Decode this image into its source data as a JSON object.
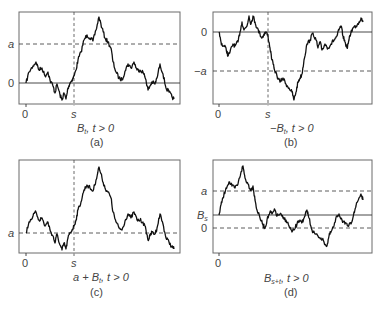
{
  "figure": {
    "panels": [
      {
        "id": "a",
        "caption": "(a)",
        "title_main": "B",
        "title_sub": "t",
        "title_rest": ", t > 0",
        "y_labels": [
          {
            "text": "a",
            "level": "a",
            "style": "dashed"
          },
          {
            "text": "0",
            "level": "0",
            "style": "solid"
          }
        ],
        "x_labels": [
          "0",
          "s"
        ],
        "stopping_time_marker": "s"
      },
      {
        "id": "b",
        "caption": "(b)",
        "title_main": "−B",
        "title_sub": "t",
        "title_rest": ", t > 0",
        "y_labels": [
          {
            "text": "0",
            "level": "0",
            "style": "solid"
          },
          {
            "text": "−a",
            "level": "-a",
            "style": "dashed"
          }
        ],
        "x_labels": [
          "0",
          "s"
        ],
        "stopping_time_marker": "s"
      },
      {
        "id": "c",
        "caption": "(c)",
        "title_main": "a + B",
        "title_sub": "t",
        "title_rest": ", t > 0",
        "y_labels": [
          {
            "text": "a",
            "level": "a",
            "style": "dashed"
          }
        ],
        "x_labels": [
          "0",
          "s"
        ],
        "stopping_time_marker": "s"
      },
      {
        "id": "d",
        "caption": "(d)",
        "title_main": "B",
        "title_sub": "s+t",
        "title_rest": ", t > 0",
        "y_labels": [
          {
            "text": "a",
            "level": "a",
            "style": "dashed"
          },
          {
            "text": "B",
            "sub": "s",
            "level": "Bs",
            "style": "solid"
          },
          {
            "text": "0",
            "level": "0",
            "style": "dashed"
          }
        ],
        "x_labels": [
          "0"
        ]
      }
    ],
    "paths": {
      "a": [
        [
          26,
          83
        ],
        [
          29,
          72
        ],
        [
          33,
          66
        ],
        [
          36,
          62
        ],
        [
          39,
          70
        ],
        [
          42,
          68
        ],
        [
          45,
          76
        ],
        [
          48,
          72
        ],
        [
          50,
          80
        ],
        [
          53,
          86
        ],
        [
          55,
          93
        ],
        [
          57,
          84
        ],
        [
          60,
          95
        ],
        [
          62,
          100
        ],
        [
          64,
          93
        ],
        [
          66,
          99
        ],
        [
          68,
          88
        ],
        [
          70,
          83
        ],
        [
          72,
          80
        ],
        [
          74,
          76
        ],
        [
          76,
          70
        ],
        [
          78,
          60
        ],
        [
          81,
          52
        ],
        [
          84,
          40
        ],
        [
          87,
          35
        ],
        [
          90,
          38
        ],
        [
          93,
          41
        ],
        [
          96,
          30
        ],
        [
          99,
          17
        ],
        [
          102,
          28
        ],
        [
          105,
          38
        ],
        [
          108,
          42
        ],
        [
          111,
          48
        ],
        [
          113,
          62
        ],
        [
          116,
          72
        ],
        [
          119,
          78
        ],
        [
          122,
          80
        ],
        [
          125,
          71
        ],
        [
          128,
          64
        ],
        [
          131,
          68
        ],
        [
          134,
          62
        ],
        [
          137,
          70
        ],
        [
          140,
          70
        ],
        [
          143,
          72
        ],
        [
          146,
          80
        ],
        [
          148,
          90
        ],
        [
          150,
          86
        ],
        [
          152,
          82
        ],
        [
          155,
          84
        ],
        [
          157,
          78
        ],
        [
          160,
          64
        ],
        [
          163,
          74
        ],
        [
          166,
          88
        ],
        [
          169,
          92
        ],
        [
          172,
          97
        ],
        [
          174,
          99
        ]
      ],
      "b": [
        [
          219,
          32
        ],
        [
          221,
          42
        ],
        [
          223,
          46
        ],
        [
          226,
          48
        ],
        [
          228,
          56
        ],
        [
          230,
          52
        ],
        [
          233,
          44
        ],
        [
          235,
          46
        ],
        [
          238,
          42
        ],
        [
          240,
          32
        ],
        [
          242,
          22
        ],
        [
          244,
          30
        ],
        [
          247,
          26
        ],
        [
          249,
          16
        ],
        [
          251,
          24
        ],
        [
          253,
          16
        ],
        [
          255,
          22
        ],
        [
          257,
          28
        ],
        [
          260,
          34
        ],
        [
          262,
          38
        ],
        [
          264,
          34
        ],
        [
          266,
          32
        ],
        [
          268,
          36
        ],
        [
          270,
          48
        ],
        [
          272,
          60
        ],
        [
          274,
          68
        ],
        [
          277,
          76
        ],
        [
          280,
          82
        ],
        [
          283,
          78
        ],
        [
          286,
          84
        ],
        [
          289,
          88
        ],
        [
          292,
          92
        ],
        [
          294,
          100
        ],
        [
          296,
          92
        ],
        [
          298,
          82
        ],
        [
          300,
          78
        ],
        [
          302,
          74
        ],
        [
          304,
          60
        ],
        [
          307,
          44
        ],
        [
          310,
          40
        ],
        [
          313,
          33
        ],
        [
          316,
          40
        ],
        [
          318,
          48
        ],
        [
          320,
          42
        ],
        [
          322,
          50
        ],
        [
          325,
          44
        ],
        [
          328,
          48
        ],
        [
          331,
          44
        ],
        [
          334,
          40
        ],
        [
          337,
          36
        ],
        [
          339,
          30
        ],
        [
          341,
          26
        ],
        [
          343,
          36
        ],
        [
          345,
          42
        ],
        [
          347,
          48
        ],
        [
          349,
          40
        ],
        [
          351,
          32
        ],
        [
          353,
          28
        ],
        [
          356,
          26
        ],
        [
          359,
          22
        ],
        [
          361,
          18
        ],
        [
          363,
          22
        ]
      ],
      "c": [
        [
          26,
          233
        ],
        [
          29,
          222
        ],
        [
          33,
          216
        ],
        [
          36,
          212
        ],
        [
          39,
          220
        ],
        [
          42,
          218
        ],
        [
          45,
          226
        ],
        [
          48,
          222
        ],
        [
          50,
          230
        ],
        [
          53,
          236
        ],
        [
          55,
          243
        ],
        [
          57,
          234
        ],
        [
          60,
          245
        ],
        [
          62,
          250
        ],
        [
          64,
          243
        ],
        [
          66,
          249
        ],
        [
          68,
          238
        ],
        [
          70,
          233
        ],
        [
          72,
          230
        ],
        [
          74,
          226
        ],
        [
          76,
          220
        ],
        [
          78,
          210
        ],
        [
          81,
          202
        ],
        [
          84,
          190
        ],
        [
          87,
          185
        ],
        [
          90,
          188
        ],
        [
          93,
          191
        ],
        [
          96,
          180
        ],
        [
          99,
          167
        ],
        [
          102,
          178
        ],
        [
          105,
          188
        ],
        [
          108,
          192
        ],
        [
          111,
          198
        ],
        [
          113,
          212
        ],
        [
          116,
          222
        ],
        [
          119,
          228
        ],
        [
          122,
          230
        ],
        [
          125,
          221
        ],
        [
          128,
          214
        ],
        [
          131,
          218
        ],
        [
          134,
          212
        ],
        [
          137,
          220
        ],
        [
          140,
          220
        ],
        [
          143,
          222
        ],
        [
          146,
          230
        ],
        [
          148,
          240
        ],
        [
          150,
          236
        ],
        [
          152,
          232
        ],
        [
          155,
          234
        ],
        [
          157,
          228
        ],
        [
          160,
          214
        ],
        [
          163,
          224
        ],
        [
          166,
          238
        ],
        [
          169,
          242
        ],
        [
          172,
          247
        ],
        [
          174,
          249
        ]
      ],
      "d": [
        [
          219,
          215
        ],
        [
          221,
          205
        ],
        [
          223,
          198
        ],
        [
          226,
          188
        ],
        [
          229,
          182
        ],
        [
          232,
          186
        ],
        [
          235,
          188
        ],
        [
          238,
          184
        ],
        [
          241,
          172
        ],
        [
          243,
          166
        ],
        [
          245,
          178
        ],
        [
          248,
          184
        ],
        [
          251,
          190
        ],
        [
          253,
          186
        ],
        [
          255,
          200
        ],
        [
          257,
          210
        ],
        [
          260,
          218
        ],
        [
          263,
          225
        ],
        [
          265,
          228
        ],
        [
          267,
          220
        ],
        [
          270,
          212
        ],
        [
          272,
          214
        ],
        [
          275,
          210
        ],
        [
          277,
          216
        ],
        [
          280,
          214
        ],
        [
          283,
          218
        ],
        [
          286,
          220
        ],
        [
          289,
          226
        ],
        [
          292,
          232
        ],
        [
          294,
          230
        ],
        [
          297,
          224
        ],
        [
          300,
          220
        ],
        [
          303,
          222
        ],
        [
          305,
          216
        ],
        [
          307,
          210
        ],
        [
          309,
          218
        ],
        [
          312,
          230
        ],
        [
          315,
          234
        ],
        [
          318,
          236
        ],
        [
          321,
          238
        ],
        [
          324,
          242
        ],
        [
          327,
          246
        ],
        [
          329,
          236
        ],
        [
          331,
          232
        ],
        [
          334,
          226
        ],
        [
          337,
          216
        ],
        [
          339,
          214
        ],
        [
          342,
          220
        ],
        [
          345,
          224
        ],
        [
          348,
          226
        ],
        [
          351,
          224
        ],
        [
          354,
          212
        ],
        [
          356,
          206
        ],
        [
          359,
          198
        ],
        [
          361,
          194
        ],
        [
          363,
          200
        ]
      ]
    },
    "colors": {
      "path": "#111111",
      "frame": "#6a6a6a",
      "reference_lines": "#333333",
      "labels": "#444444"
    }
  }
}
